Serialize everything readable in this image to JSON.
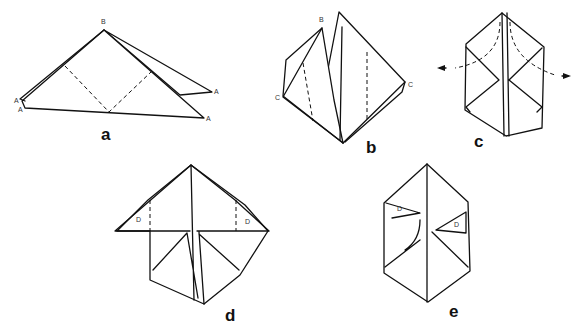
{
  "steps": [
    {
      "id": "a",
      "label": "a",
      "points": [
        "B",
        "A",
        "A",
        "A",
        "A"
      ]
    },
    {
      "id": "b",
      "label": "b",
      "points": [
        "B",
        "C",
        "C"
      ]
    },
    {
      "id": "c",
      "label": "c"
    },
    {
      "id": "d",
      "label": "d",
      "points": [
        "D",
        "D"
      ]
    },
    {
      "id": "e",
      "label": "e",
      "points": [
        "D",
        "D"
      ]
    }
  ]
}
